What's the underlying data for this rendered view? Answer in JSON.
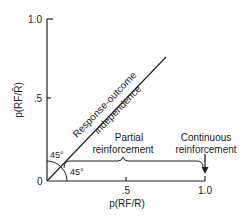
{
  "diagram": {
    "y_axis": {
      "label": "p(RF/R̄)",
      "ticks": [
        ".5",
        "1.0"
      ]
    },
    "x_axis": {
      "label": "p(RF/R)",
      "ticks": [
        ".5",
        "1.0"
      ]
    },
    "origin_label": "0",
    "diagonal": {
      "label_line1": "Response-outcome",
      "label_line2": "independence"
    },
    "angle_upper": "45°",
    "angle_lower": "45°",
    "partial": {
      "line1": "Partial",
      "line2": "reinforcement"
    },
    "continuous": {
      "line1": "Continuous",
      "line2": "reinforcement"
    },
    "colors": {
      "ink": "#222222",
      "background": "#ffffff"
    }
  }
}
